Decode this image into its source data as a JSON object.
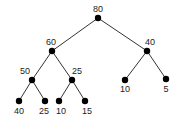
{
  "diagram": {
    "type": "binary-tree",
    "nodes": [
      {
        "id": "n0",
        "value": "80",
        "x": 98,
        "y": 18,
        "lx": 98,
        "ly": 12,
        "anchor": "middle"
      },
      {
        "id": "n1",
        "value": "60",
        "x": 52,
        "y": 51,
        "lx": 51,
        "ly": 45,
        "anchor": "middle"
      },
      {
        "id": "n2",
        "value": "40",
        "x": 147,
        "y": 51,
        "lx": 150,
        "ly": 45,
        "anchor": "middle"
      },
      {
        "id": "n3",
        "value": "50",
        "x": 32,
        "y": 80,
        "lx": 25,
        "ly": 74,
        "anchor": "middle"
      },
      {
        "id": "n4",
        "value": "25",
        "x": 72,
        "y": 80,
        "lx": 77,
        "ly": 74,
        "anchor": "middle"
      },
      {
        "id": "n5",
        "value": "10",
        "x": 125,
        "y": 80,
        "lx": 125,
        "ly": 92,
        "anchor": "middle"
      },
      {
        "id": "n6",
        "value": "5",
        "x": 166,
        "y": 79,
        "lx": 166,
        "ly": 92,
        "anchor": "middle"
      },
      {
        "id": "n7",
        "value": "40",
        "x": 19,
        "y": 101,
        "lx": 19,
        "ly": 114,
        "anchor": "middle"
      },
      {
        "id": "n8",
        "value": "25",
        "x": 45,
        "y": 101,
        "lx": 44,
        "ly": 114,
        "anchor": "middle"
      },
      {
        "id": "n9",
        "value": "10",
        "x": 59,
        "y": 101,
        "lx": 61,
        "ly": 114,
        "anchor": "middle"
      },
      {
        "id": "n10",
        "value": "15",
        "x": 85,
        "y": 101,
        "lx": 87,
        "ly": 114,
        "anchor": "middle"
      }
    ],
    "edges": [
      [
        "n0",
        "n1"
      ],
      [
        "n0",
        "n2"
      ],
      [
        "n1",
        "n3"
      ],
      [
        "n1",
        "n4"
      ],
      [
        "n2",
        "n5"
      ],
      [
        "n2",
        "n6"
      ],
      [
        "n3",
        "n7"
      ],
      [
        "n3",
        "n8"
      ],
      [
        "n4",
        "n9"
      ],
      [
        "n4",
        "n10"
      ]
    ]
  }
}
